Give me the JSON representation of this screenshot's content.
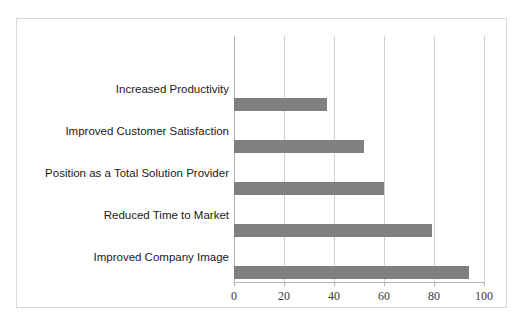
{
  "chart_data": {
    "type": "bar",
    "orientation": "horizontal",
    "title": "",
    "subtitle": "",
    "xlabel": "",
    "ylabel": "",
    "xlim": [
      0,
      100
    ],
    "xticks": [
      "0",
      "20",
      "40",
      "60",
      "80",
      "100"
    ],
    "grid": true,
    "legend": false,
    "legend_position": "none",
    "bar_color": "#808080",
    "gridline_color": "#d0d0d0",
    "frame_color": "#d9d9d9",
    "categories": [
      "Increased Productivity",
      "Improved Customer Satisfaction",
      "Position as a Total Solution Provider",
      "Reduced Time to Market",
      "Improved Company Image"
    ],
    "values": [
      37,
      52,
      60,
      79,
      94
    ],
    "series": [
      {
        "name": "",
        "values": [
          37,
          52,
          60,
          79,
          94
        ]
      }
    ]
  }
}
